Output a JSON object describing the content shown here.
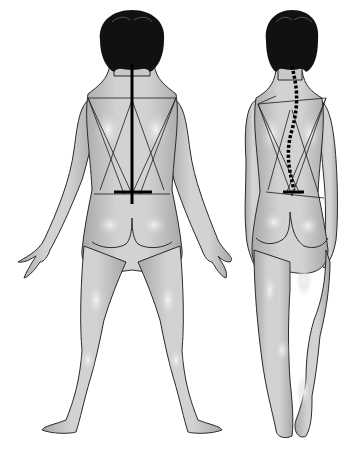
{
  "figure": {
    "panels": [
      {
        "id": "normal",
        "label": "Normal spine alignment",
        "spine_style": "straight-solid"
      },
      {
        "id": "scoliosis",
        "label": "Scoliosis (curved spine)",
        "spine_style": "curved-dashed"
      }
    ]
  },
  "colors": {
    "skin": "#c9c9c9",
    "skin_highlight": "#efefef",
    "outline": "#2a2a2a",
    "hair": "#111111",
    "spine": "#000000",
    "background": "#ffffff"
  }
}
